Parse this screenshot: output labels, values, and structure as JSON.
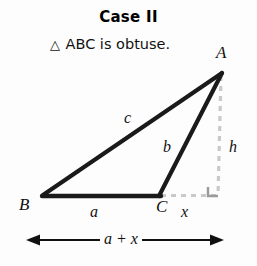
{
  "figure": {
    "title": "Case II",
    "subtitle_triangle_glyph": "△",
    "subtitle_text": "ABC is obtuse.",
    "background_color": "#fdfdfd",
    "stroke_color": "#1a1a1a",
    "dashed_color": "#c9c9c9"
  },
  "labels": {
    "vertex_a": "A",
    "vertex_b": "B",
    "vertex_c": "C",
    "side_c": "c",
    "side_b": "b",
    "side_a": "a",
    "segment_x": "x",
    "height_h": "h",
    "base_sum": "a + x"
  },
  "geometry": {
    "vertex_a": [
      222,
      72
    ],
    "vertex_b": [
      42,
      196
    ],
    "vertex_c": [
      160,
      196
    ],
    "foot_of_altitude": [
      218,
      196
    ],
    "dimension_arrow_y": 240,
    "dimension_arrow_x_start": 28,
    "dimension_arrow_x_end": 222
  }
}
